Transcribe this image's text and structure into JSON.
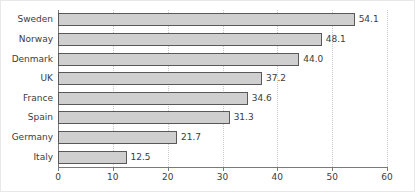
{
  "chart_data": {
    "type": "bar",
    "orientation": "horizontal",
    "title": "",
    "xlabel": "",
    "ylabel": "",
    "categories": [
      "Sweden",
      "Norway",
      "Denmark",
      "UK",
      "France",
      "Spain",
      "Germany",
      "Italy"
    ],
    "values": [
      54.1,
      48.1,
      44.0,
      37.2,
      34.6,
      31.3,
      21.7,
      12.5
    ],
    "value_labels": [
      "54.1",
      "48.1",
      "44.0",
      "37.2",
      "34.6",
      "31.3",
      "21.7",
      "12.5"
    ],
    "xlim": [
      0,
      60
    ],
    "xticks": [
      0,
      10,
      20,
      30,
      40,
      50,
      60
    ],
    "xtick_labels": [
      "0",
      "10",
      "20",
      "30",
      "40",
      "50",
      "60"
    ],
    "grid": "vertical-dotted",
    "legend": null,
    "bar_fill_color": "#cfcfcf",
    "bar_edge_color": "#595959",
    "axis_color": "#7a7a7a",
    "grid_color": "#c8c8c8",
    "text_color": "#3c3c3c",
    "background_color": "#ffffff"
  }
}
